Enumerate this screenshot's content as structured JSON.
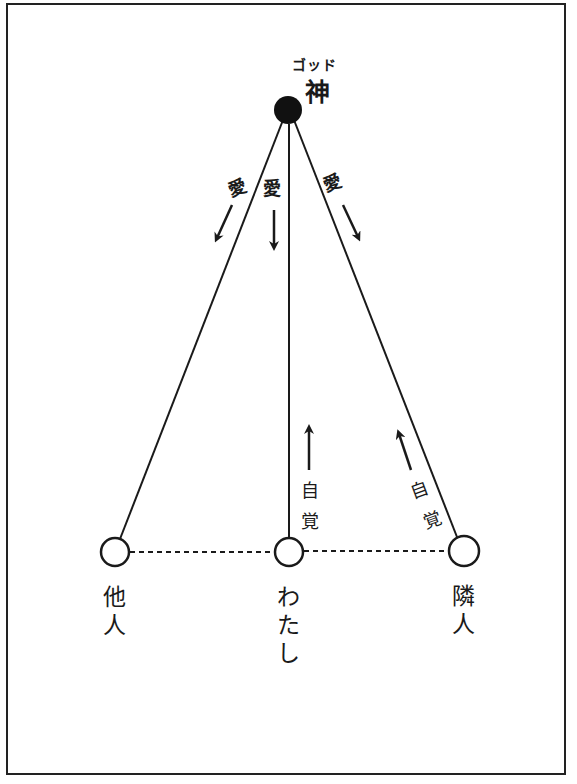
{
  "diagram": {
    "god": {
      "ruby": "ゴッド",
      "label": "神",
      "fill": "#111111"
    },
    "love_labels": [
      {
        "text": "愛",
        "direction": "down-left"
      },
      {
        "text": "愛",
        "direction": "down"
      },
      {
        "text": "愛",
        "direction": "down-right"
      }
    ],
    "awareness_labels": [
      {
        "chars": [
          "自",
          "覚"
        ],
        "direction": "up"
      },
      {
        "chars": [
          "自",
          "覚"
        ],
        "direction": "up-left"
      }
    ],
    "nodes": [
      {
        "id": "others",
        "chars": [
          "他",
          "人"
        ]
      },
      {
        "id": "me",
        "chars": [
          "わ",
          "た",
          "し"
        ]
      },
      {
        "id": "neighbor",
        "chars": [
          "隣",
          "人"
        ]
      }
    ],
    "colors": {
      "line": "#1a1a1a",
      "background": "#ffffff",
      "frame": "#222222"
    }
  }
}
